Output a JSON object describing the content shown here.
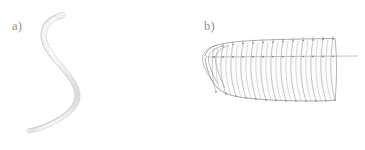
{
  "figure": {
    "background_color": "#ffffff",
    "width": 365,
    "height": 150,
    "caption_style": "serif-italic-lowercase"
  },
  "panels": [
    {
      "id": "a",
      "label": "a)",
      "label_color": "#8e8e8e",
      "subject": "earthworm-photograph",
      "description": "Photograph of a live segmented annelid worm curved in an S shape, head at upper area, tail tapering toward lower left",
      "render_type": "photograph-silhouette",
      "body_color": "#e9e9e9",
      "outline_color": "#d2d2d2",
      "segment_line_color": "#dcdcdc",
      "segment_count": 96,
      "orientation": "vertical-S-curve",
      "head_position": "top-left",
      "tail_position": "bottom-left"
    },
    {
      "id": "b",
      "label": "b)",
      "label_color": "#8e8e8e",
      "subject": "worm-wireframe-mesh-model",
      "description": "Wireframe polygonal mesh reconstruction of the worm body showing segmental rings, a dorsal top edge with node markers, a ventral bottom edge, a rounded anterior cap at the left and a central axis line extending past the posterior at the right",
      "render_type": "wireframe-mesh",
      "mesh_line_color": "#9a9a9a",
      "mesh_fill_color": "#fbfbfb",
      "node_color": "#7d7d7d",
      "axis_line_color": "#a8a8a8",
      "ring_count": 15,
      "orientation": "horizontal",
      "anterior_position": "left",
      "posterior_position": "right",
      "has_center_axis": true,
      "has_top_nodes": true,
      "has_bottom_nodes": true
    }
  ]
}
